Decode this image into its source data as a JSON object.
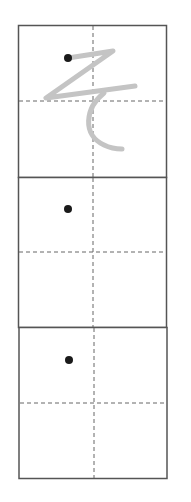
{
  "worksheet": {
    "character": "そ",
    "cells": [
      {
        "index": 1,
        "has_trace_guide": true,
        "start_dot": true
      },
      {
        "index": 2,
        "has_trace_guide": false,
        "start_dot": true
      },
      {
        "index": 3,
        "has_trace_guide": false,
        "start_dot": true
      }
    ],
    "colors": {
      "border": "#555555",
      "guide_line": "#666666",
      "trace_stroke": "#c4c4c4",
      "dot": "#1a1a1a",
      "background": "#ffffff"
    }
  }
}
